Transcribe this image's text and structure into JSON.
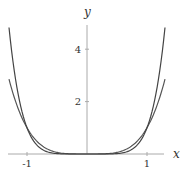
{
  "chart_data": {
    "type": "line",
    "title": "",
    "xlabel": "x",
    "ylabel": "y",
    "xlim": [
      -1.32,
      1.27
    ],
    "ylim": [
      0,
      5
    ],
    "grid": false,
    "legend": null,
    "x_ticks": [
      {
        "value": -1,
        "label": "-1"
      },
      {
        "value": 1,
        "label": "1"
      }
    ],
    "y_ticks": [
      {
        "value": 2,
        "label": "2"
      },
      {
        "value": 4,
        "label": "4"
      }
    ],
    "x_domain": [
      -1.3,
      1.3
    ],
    "series": [
      {
        "name": "y = x^4",
        "exponent": 4,
        "color": "#555555",
        "x": [
          -1.3,
          -1.2,
          -1.0,
          -0.8,
          -0.6,
          -0.4,
          -0.2,
          0,
          0.2,
          0.4,
          0.6,
          0.8,
          1.0,
          1.2,
          1.3
        ],
        "values": [
          2.86,
          2.07,
          1.0,
          0.41,
          0.13,
          0.03,
          0.0,
          0,
          0.0,
          0.03,
          0.13,
          0.41,
          1.0,
          2.07,
          2.86
        ]
      },
      {
        "name": "y = x^6",
        "exponent": 6,
        "color": "#444444",
        "x": [
          -1.3,
          -1.2,
          -1.0,
          -0.8,
          -0.6,
          -0.4,
          -0.2,
          0,
          0.2,
          0.4,
          0.6,
          0.8,
          1.0,
          1.2,
          1.3
        ],
        "values": [
          4.83,
          2.99,
          1.0,
          0.26,
          0.05,
          0.0,
          0.0,
          0,
          0.0,
          0.0,
          0.05,
          0.26,
          1.0,
          2.99,
          4.83
        ]
      }
    ]
  },
  "colors": {
    "axis": "#aaaaaa",
    "curve": "#555555",
    "text": "#333333"
  }
}
